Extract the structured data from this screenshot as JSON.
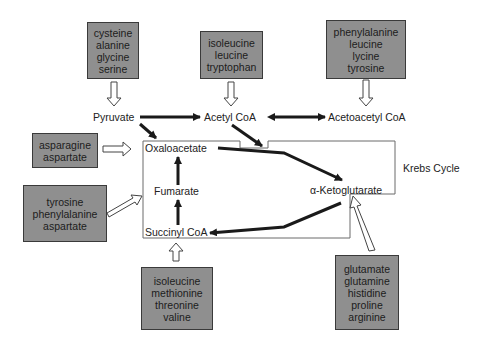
{
  "colors": {
    "box_fill": "#8f8f8f",
    "box_border": "#3a3a3a",
    "arrow": "#1a1a1a",
    "open_arrow": "#ffffff"
  },
  "source_boxes": [
    {
      "id": "pyruvate-sources",
      "items": [
        "cysteine",
        "alanine",
        "glycine",
        "serine"
      ]
    },
    {
      "id": "acetyl-coa-sources",
      "items": [
        "isoleucine",
        "leucine",
        "tryptophan"
      ]
    },
    {
      "id": "acetoacetyl-coa-sources",
      "items": [
        "phenylalanine",
        "leucine",
        "lycine",
        "tyrosine"
      ]
    },
    {
      "id": "oxaloacetate-sources",
      "items": [
        "asparagine",
        "aspartate"
      ]
    },
    {
      "id": "fumarate-sources",
      "items": [
        "tyrosine",
        "phenylalanine",
        "aspartate"
      ]
    },
    {
      "id": "succinyl-coa-sources",
      "items": [
        "isoleucine",
        "methionine",
        "threonine",
        "valine"
      ]
    },
    {
      "id": "ketoglutarate-sources",
      "items": [
        "glutamate",
        "glutamine",
        "histidine",
        "proline",
        "arginine"
      ]
    }
  ],
  "metabolites": {
    "pyruvate": "Pyruvate",
    "acetyl_coa": "Acetyl CoA",
    "acetoacetyl_coa": "Acetoacetyl CoA",
    "oxaloacetate": "Oxaloacetate",
    "fumarate": "Fumarate",
    "succinyl_coa": "Succinyl CoA",
    "ketoglutarate": "α-Ketoglutarate"
  },
  "cycle_label": "Krebs Cycle"
}
